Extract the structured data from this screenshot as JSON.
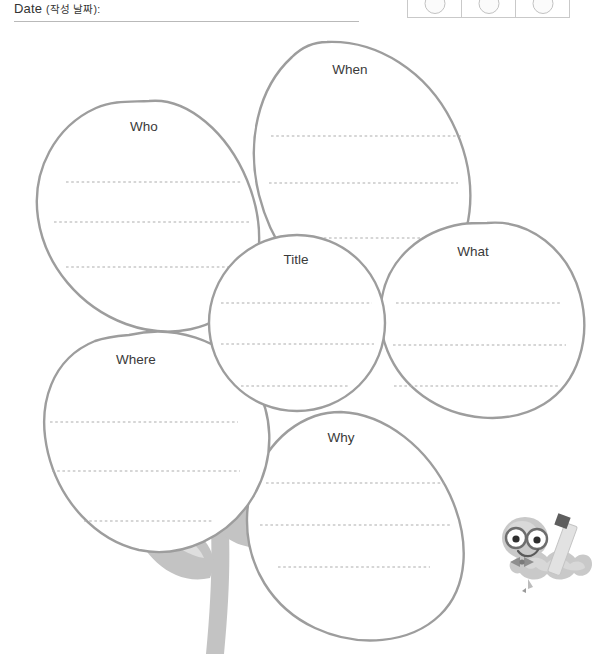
{
  "header": {
    "date_label_en": "Date",
    "date_label_ko": "(작성 날짜):",
    "stamp_cells": [
      {
        "circle": "stamp-circle"
      },
      {
        "circle": "stamp-circle"
      },
      {
        "circle": "stamp-circle"
      }
    ]
  },
  "worksheet": {
    "center": {
      "label": "Title",
      "lines": 3
    },
    "petals": [
      {
        "id": "who",
        "label": "Who",
        "lines": 3
      },
      {
        "id": "when",
        "label": "When",
        "lines": 3
      },
      {
        "id": "what",
        "label": "What",
        "lines": 3
      },
      {
        "id": "why",
        "label": "Why",
        "lines": 3
      },
      {
        "id": "where",
        "label": "Where",
        "lines": 3
      }
    ]
  },
  "decoration": {
    "stem": "flower-stem",
    "leaf_left": "leaf-left",
    "leaf_right": "leaf-right",
    "mascot": "bookworm-mascot-with-glasses-and-pencil"
  },
  "colors": {
    "outline": "#9d9d9d",
    "dashed_line": "#adadad",
    "stem": "#c3c3c3",
    "text": "#3a3a3a",
    "rule": "#b9b9b9",
    "table_border": "#c9c9c9"
  }
}
